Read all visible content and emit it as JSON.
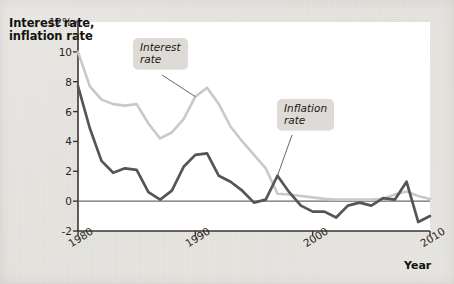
{
  "chart_data": {
    "type": "line",
    "title": "",
    "ylabel": "Interest rate,\ninflation rate",
    "xlabel": "Year",
    "ylim": [
      -2,
      12
    ],
    "xlim": [
      1980,
      2010
    ],
    "grid": false,
    "legend_position": "inline-callouts",
    "ytick_labels": [
      "12%",
      "10",
      "8",
      "6",
      "4",
      "2",
      "0",
      "-2"
    ],
    "ytick_values": [
      12,
      10,
      8,
      6,
      4,
      2,
      0,
      -2
    ],
    "xtick_labels": [
      "1980",
      "1990",
      "2000",
      "2010"
    ],
    "xtick_values": [
      1980,
      1990,
      2000,
      2010
    ],
    "zero_line": 0,
    "x": [
      1980,
      1981,
      1982,
      1983,
      1984,
      1985,
      1986,
      1987,
      1988,
      1989,
      1990,
      1991,
      1992,
      1993,
      1994,
      1995,
      1996,
      1997,
      1998,
      1999,
      2000,
      2001,
      2002,
      2003,
      2004,
      2005,
      2006,
      2007,
      2008,
      2009,
      2010
    ],
    "series": [
      {
        "name": "Interest rate",
        "color": "#c9c9c9",
        "values": [
          10.0,
          7.7,
          6.8,
          6.5,
          6.4,
          6.5,
          5.2,
          4.2,
          4.6,
          5.5,
          7.0,
          7.6,
          6.5,
          5.0,
          4.0,
          3.1,
          2.2,
          0.5,
          0.45,
          0.35,
          0.25,
          0.15,
          0.1,
          0.1,
          0.1,
          0.1,
          0.15,
          0.45,
          0.65,
          0.35,
          0.15
        ]
      },
      {
        "name": "Inflation rate",
        "color": "#555555",
        "values": [
          7.7,
          4.9,
          2.7,
          1.9,
          2.2,
          2.1,
          0.6,
          0.1,
          0.7,
          2.3,
          3.1,
          3.2,
          1.7,
          1.3,
          0.7,
          -0.1,
          0.1,
          1.7,
          0.6,
          -0.3,
          -0.7,
          -0.7,
          -1.1,
          -0.3,
          -0.1,
          -0.3,
          0.2,
          0.1,
          1.3,
          -1.4,
          -1.0
        ]
      }
    ],
    "annotations": [
      {
        "label": "Interest\nrate",
        "target_x": 1990,
        "target_y": 7.0
      },
      {
        "label": "Inflation\nrate",
        "target_x": 1997,
        "target_y": 1.7
      }
    ]
  }
}
